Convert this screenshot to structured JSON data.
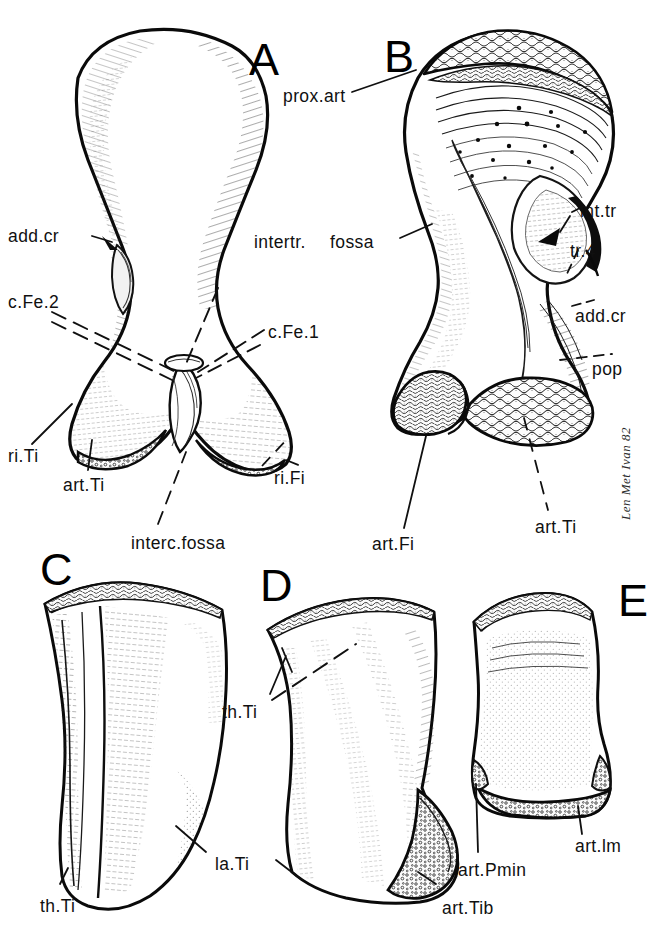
{
  "figure": {
    "background_color": "#ffffff",
    "ink_color": "#101010",
    "caption_note": "",
    "signature": "Len Met Ivan 82",
    "panels": [
      {
        "id": "A",
        "letter": "A",
        "x": 249,
        "y": 37
      },
      {
        "id": "B",
        "letter": "B",
        "x": 384,
        "y": 34
      },
      {
        "id": "C",
        "letter": "C",
        "x": 40,
        "y": 547
      },
      {
        "id": "D",
        "letter": "D",
        "x": 260,
        "y": 563
      },
      {
        "id": "E",
        "letter": "E",
        "x": 618,
        "y": 578
      }
    ],
    "labels": [
      {
        "name": "prox-art",
        "text": "prox.art",
        "x": 283,
        "y": 88,
        "panel": "B"
      },
      {
        "name": "add-cr-a",
        "text": "add.cr",
        "x": 8,
        "y": 228,
        "panel": "A"
      },
      {
        "name": "intertr",
        "text": "intertr.",
        "x": 254,
        "y": 234,
        "panel": "A"
      },
      {
        "name": "fossa",
        "text": "fossa",
        "x": 330,
        "y": 234,
        "panel": "B"
      },
      {
        "name": "int-tr",
        "text": "int.tr",
        "x": 580,
        "y": 203,
        "panel": "B"
      },
      {
        "name": "tr-4",
        "text": "tr.4",
        "x": 570,
        "y": 243,
        "panel": "B"
      },
      {
        "name": "c-fe-2",
        "text": "c.Fe.2",
        "x": 8,
        "y": 294,
        "panel": "A"
      },
      {
        "name": "c-fe-1",
        "text": "c.Fe.1",
        "x": 268,
        "y": 324,
        "panel": "A"
      },
      {
        "name": "add-cr-b",
        "text": "add.cr",
        "x": 575,
        "y": 308,
        "panel": "B"
      },
      {
        "name": "pop",
        "text": "pop",
        "x": 592,
        "y": 361,
        "panel": "B"
      },
      {
        "name": "ri-ti",
        "text": "ri.Ti",
        "x": 8,
        "y": 448,
        "panel": "A"
      },
      {
        "name": "ri-fi",
        "text": "ri.Fi",
        "x": 274,
        "y": 470,
        "panel": "A"
      },
      {
        "name": "art-ti-a",
        "text": "art.Ti",
        "x": 63,
        "y": 477,
        "panel": "A"
      },
      {
        "name": "art-fi",
        "text": "art.Fi",
        "x": 372,
        "y": 536,
        "panel": "B"
      },
      {
        "name": "art-ti-b",
        "text": "art.Ti",
        "x": 535,
        "y": 519,
        "panel": "B"
      },
      {
        "name": "interc-fossa",
        "text": "interc.fossa",
        "x": 131,
        "y": 535,
        "panel": "A"
      },
      {
        "name": "th-ti-d",
        "text": "th.Ti",
        "x": 222,
        "y": 704,
        "panel": "D"
      },
      {
        "name": "la-ti",
        "text": "la.Ti",
        "x": 215,
        "y": 856,
        "panel": "C"
      },
      {
        "name": "art-lm",
        "text": "art.lm",
        "x": 575,
        "y": 838,
        "panel": "E"
      },
      {
        "name": "art-pmin",
        "text": "art.Pmin",
        "x": 458,
        "y": 862,
        "panel": "E"
      },
      {
        "name": "art-tib",
        "text": "art.Tib",
        "x": 442,
        "y": 900,
        "panel": "D"
      },
      {
        "name": "th-ti-c",
        "text": "th.Ti",
        "x": 40,
        "y": 898,
        "panel": "C"
      }
    ]
  }
}
